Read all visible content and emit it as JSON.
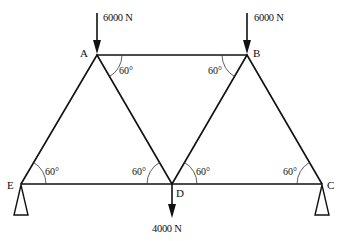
{
  "diagram": {
    "type": "truss",
    "nodes": {
      "A": {
        "label": "A",
        "x": 97,
        "y": 55
      },
      "B": {
        "label": "B",
        "x": 247,
        "y": 55
      },
      "C": {
        "label": "C",
        "x": 322,
        "y": 184
      },
      "D": {
        "label": "D",
        "x": 172,
        "y": 184
      },
      "E": {
        "label": "E",
        "x": 21,
        "y": 184
      }
    },
    "members": [
      {
        "from": "A",
        "to": "B"
      },
      {
        "from": "E",
        "to": "D"
      },
      {
        "from": "D",
        "to": "C"
      },
      {
        "from": "E",
        "to": "A"
      },
      {
        "from": "A",
        "to": "D"
      },
      {
        "from": "D",
        "to": "B"
      },
      {
        "from": "B",
        "to": "C"
      }
    ],
    "loads": [
      {
        "node": "A",
        "label": "6000 N",
        "direction": "down"
      },
      {
        "node": "B",
        "label": "6000 N",
        "direction": "down"
      },
      {
        "node": "D",
        "label": "4000 N",
        "direction": "down"
      }
    ],
    "angles": [
      {
        "at": "A",
        "label": "60°"
      },
      {
        "at": "B",
        "label": "60°"
      },
      {
        "at": "E",
        "label": "60°"
      },
      {
        "at": "D_left",
        "label": "60°"
      },
      {
        "at": "D_right",
        "label": "60°"
      },
      {
        "at": "C",
        "label": "60°"
      }
    ],
    "supports": [
      {
        "node": "E",
        "type": "pin"
      },
      {
        "node": "C",
        "type": "pin"
      }
    ]
  }
}
